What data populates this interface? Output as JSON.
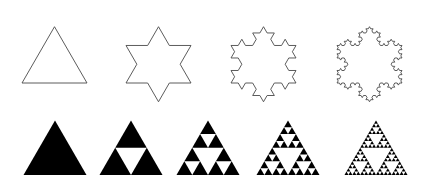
{
  "figure": {
    "background_color": "#ffffff",
    "width": 424,
    "height": 188,
    "rows": [
      {
        "name": "koch-snowflake-row",
        "label": "Koch snowflake iterations",
        "fractal": "koch-snowflake",
        "render": "outline",
        "stroke_color": "#4a4a4a",
        "fill_color": "none",
        "stroke_width": 0.9,
        "items": [
          {
            "name": "koch-iteration-0",
            "label": "Koch iteration 0 (equilateral triangle)",
            "iteration": 0,
            "segments": 3,
            "center_x": 54.5,
            "base_y": 83.0,
            "side": 65.0,
            "apex_y": 26.7
          },
          {
            "name": "koch-iteration-1",
            "label": "Koch iteration 1 (six-pointed star)",
            "iteration": 1,
            "segments": 12,
            "center_x": 158.5,
            "base_y": 83.0,
            "side": 65.0,
            "apex_y": 26.7
          },
          {
            "name": "koch-iteration-2",
            "label": "Koch iteration 2",
            "iteration": 2,
            "segments": 48,
            "center_x": 263.5,
            "base_y": 83.0,
            "side": 65.0,
            "apex_y": 26.7
          },
          {
            "name": "koch-iteration-3",
            "label": "Koch iteration 3",
            "iteration": 3,
            "segments": 192,
            "center_x": 369.5,
            "base_y": 83.0,
            "side": 65.0,
            "apex_y": 26.7
          }
        ]
      },
      {
        "name": "sierpinski-triangle-row",
        "label": "Sierpinski triangle iterations",
        "fractal": "sierpinski-triangle",
        "render": "filled",
        "stroke_color": "none",
        "fill_color": "#000000",
        "stroke_width": 0,
        "items": [
          {
            "name": "sierpinski-iteration-0",
            "label": "Sierpinski iteration 0 (solid triangle)",
            "iteration": 0,
            "filled_triangles": 1,
            "center_x": 55.0,
            "base_y": 175.0,
            "side": 63.0,
            "apex_y": 120.4
          },
          {
            "name": "sierpinski-iteration-1",
            "label": "Sierpinski iteration 1",
            "iteration": 1,
            "filled_triangles": 3,
            "center_x": 131.0,
            "base_y": 175.0,
            "side": 63.0,
            "apex_y": 120.4
          },
          {
            "name": "sierpinski-iteration-2",
            "label": "Sierpinski iteration 2",
            "iteration": 2,
            "filled_triangles": 9,
            "center_x": 208.0,
            "base_y": 175.0,
            "side": 63.0,
            "apex_y": 120.4
          },
          {
            "name": "sierpinski-iteration-3",
            "label": "Sierpinski iteration 3",
            "iteration": 3,
            "filled_triangles": 27,
            "center_x": 288.0,
            "base_y": 175.0,
            "side": 63.0,
            "apex_y": 120.4
          },
          {
            "name": "sierpinski-iteration-4",
            "label": "Sierpinski iteration 4",
            "iteration": 4,
            "filled_triangles": 81,
            "center_x": 376.0,
            "base_y": 175.0,
            "side": 63.0,
            "apex_y": 120.4
          }
        ]
      }
    ]
  }
}
